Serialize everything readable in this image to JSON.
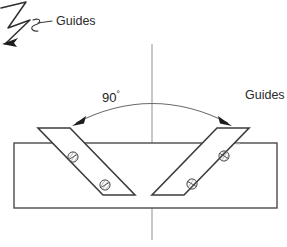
{
  "diagram": {
    "background_color": "#ffffff",
    "line_color": "#3a3a3a",
    "centerline_color": "#8a8a8a",
    "dashed_color": "#9a9a9a",
    "text_color": "#2b2b2b",
    "labels": {
      "guides_left": "Guides",
      "guides_right": "Guides",
      "angle_value": "90",
      "angle_unit": "°"
    },
    "annotations": {
      "angle_between_guides": "90",
      "angle_arc_arrowheads": 2,
      "leader_arrow_style": "hand-drawn-zigzag"
    },
    "parts": {
      "workpiece": {
        "name": "workpiece-rectangle",
        "x": 14,
        "y": 143,
        "width": 263,
        "height": 65
      },
      "guide_left": {
        "name": "guide-left-parallelogram",
        "screw_count": 2
      },
      "guide_right": {
        "name": "guide-right-parallelogram",
        "screw_count": 2
      },
      "centerline": {
        "name": "vertical-centerline",
        "x": 152,
        "y1": 44,
        "y2": 240
      }
    }
  }
}
